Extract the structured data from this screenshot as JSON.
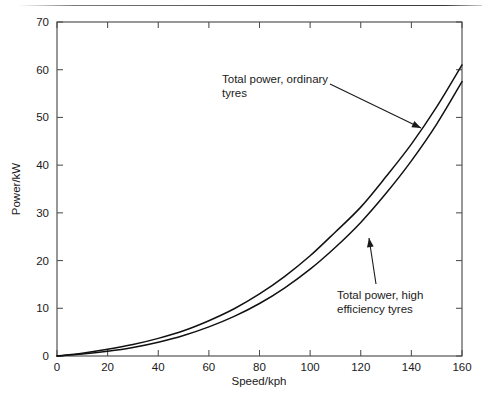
{
  "figure": {
    "background_color": "#ffffff",
    "top_rule": true,
    "frame_color": "#4d4d4d",
    "curve_color": "#111111"
  },
  "chart_data": {
    "type": "line",
    "title": "",
    "xlabel": "Speed/kph",
    "ylabel": "Power/kW",
    "xlim": [
      0,
      160
    ],
    "ylim": [
      0,
      70
    ],
    "xticks": [
      0,
      20,
      40,
      60,
      80,
      100,
      120,
      140,
      160
    ],
    "yticks": [
      0,
      10,
      20,
      30,
      40,
      50,
      60,
      70
    ],
    "xtick_labels": [
      "0",
      "20",
      "40",
      "60",
      "80",
      "100",
      "120",
      "140",
      "160"
    ],
    "ytick_labels": [
      "0",
      "10",
      "20",
      "30",
      "40",
      "50",
      "60",
      "70"
    ],
    "grid": false,
    "legend_position": "none",
    "ticks_direction": "in",
    "frame": "all four spines",
    "x": [
      0,
      10,
      20,
      30,
      40,
      50,
      60,
      70,
      80,
      90,
      100,
      110,
      120,
      130,
      140,
      150,
      160
    ],
    "series": [
      {
        "name": "Total power, ordinary tyres",
        "values": [
          0.0,
          0.6,
          1.4,
          2.4,
          3.7,
          5.3,
          7.4,
          9.9,
          13.0,
          16.7,
          21.0,
          26.0,
          31.2,
          37.6,
          44.4,
          52.2,
          61.0
        ]
      },
      {
        "name": "Total power, high efficiency tyres",
        "values": [
          0.0,
          0.4,
          1.0,
          1.8,
          2.9,
          4.3,
          6.1,
          8.3,
          11.0,
          14.3,
          18.2,
          22.8,
          28.0,
          34.1,
          40.9,
          48.6,
          57.5
        ]
      }
    ],
    "annotations": [
      {
        "id": "ordinary-tyres",
        "text_line_1": "Total power, ordinary",
        "text_line_2": "tyres",
        "text_x": 222,
        "text_y": 83,
        "leader_from_x": 330,
        "leader_from_y": 84,
        "leader_to_x": 421,
        "leader_to_y": 128
      },
      {
        "id": "high-efficiency-tyres",
        "text_line_1": "Total power, high",
        "text_line_2": "efficiency tyres",
        "text_x": 337,
        "text_y": 299,
        "leader_from_x": 376,
        "leader_from_y": 284,
        "leader_to_x": 369,
        "leader_to_y": 238
      }
    ]
  }
}
